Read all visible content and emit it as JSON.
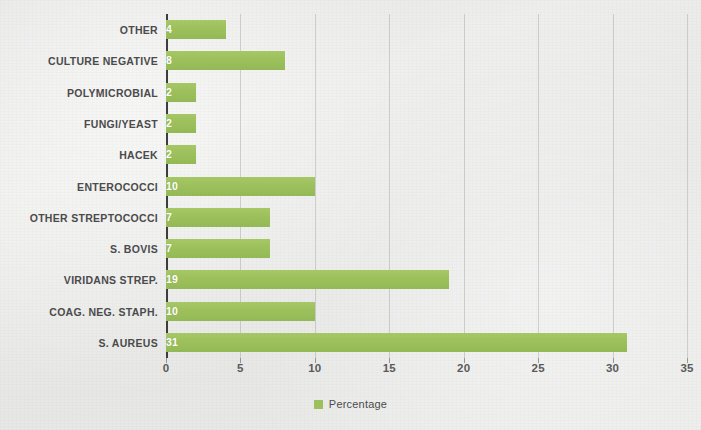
{
  "chart_data": {
    "type": "bar",
    "orientation": "horizontal",
    "title": "",
    "xlabel": "",
    "ylabel": "",
    "xlim": [
      0,
      35
    ],
    "xticks": [
      0,
      5,
      10,
      15,
      20,
      25,
      30,
      35
    ],
    "xtick_labels": [
      "0",
      "5",
      "10",
      "15",
      "20",
      "25",
      "30",
      "35"
    ],
    "grid": true,
    "grid_axis": "x",
    "legend": {
      "position": "bottom-center",
      "entries": [
        {
          "label": "Percentage",
          "color": "#9cc05c",
          "marker": "square"
        }
      ]
    },
    "categories": [
      "OTHER",
      "CULTURE NEGATIVE",
      "POLYMICROBIAL",
      "FUNGI/YEAST",
      "HACEK",
      "ENTEROCOCCI",
      "OTHER STREPTOCOCCI",
      "S. BOVIS",
      "VIRIDANS STREP.",
      "COAG. NEG. STAPH.",
      "S. AUREUS"
    ],
    "series": [
      {
        "name": "Percentage",
        "color": "#9cc05c",
        "values": [
          4,
          8,
          2,
          2,
          2,
          10,
          7,
          7,
          19,
          10,
          31
        ],
        "data_labels": [
          "4",
          "8",
          "2",
          "2",
          "2",
          "10",
          "7",
          "7",
          "19",
          "10",
          "31"
        ]
      }
    ],
    "colors": {
      "bar": "#9cc05c",
      "axis": "#3d3d3d",
      "gridline": "#969896",
      "category_text": "#4b4b4b",
      "tick_text": "#5a5a5a",
      "value_text": "#ffffff",
      "background": "#eaeae8"
    }
  }
}
